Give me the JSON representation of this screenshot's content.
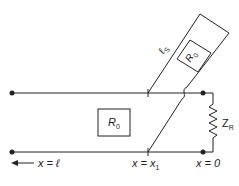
{
  "diagram": {
    "type": "transmission-line-stub",
    "stroke_color": "#222222",
    "background": "#ffffff",
    "main_line": {
      "impedance_label": "R",
      "impedance_sub": "0"
    },
    "stub": {
      "length_label": "ℓ",
      "length_sub": "S",
      "impedance_label": "R",
      "impedance_sub": "0"
    },
    "load": {
      "label": "Z",
      "sub": "R"
    },
    "positions": {
      "left_label": "x = ℓ",
      "stub_label_main": "x = x",
      "stub_label_sub": "1",
      "load_label": "x = 0"
    },
    "arrow": "left-arrow"
  }
}
